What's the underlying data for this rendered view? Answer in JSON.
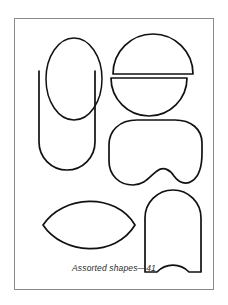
{
  "figure": {
    "caption": "Assorted shapes—41",
    "frame": {
      "border_color": "#8a8a8a",
      "background_color": "#ffffff"
    },
    "stroke_color": "#111111",
    "fill_color": "none",
    "shapes": [
      {
        "id": "ellipse-vertical",
        "name": "vertical-ellipse",
        "label": "Vertical ellipse",
        "position": "top-left"
      },
      {
        "id": "u-shape",
        "name": "open-top-u-shape",
        "label": "Open-top U shape",
        "position": "middle-left"
      },
      {
        "id": "circle-top-half",
        "name": "circle-upper-half",
        "label": "Upper half circle",
        "position": "top-right"
      },
      {
        "id": "circle-bottom-half",
        "name": "circle-lower-half",
        "label": "Lower half circle",
        "position": "top-right"
      },
      {
        "id": "kidney",
        "name": "kidney-bean-shape",
        "label": "Kidney bean shape",
        "position": "middle-right"
      },
      {
        "id": "lens",
        "name": "lens-vesica-shape",
        "label": "Lens (vesica) shape",
        "position": "bottom-left"
      },
      {
        "id": "arch-notched",
        "name": "arch-with-notch-shape",
        "label": "Arch with semicircular notch",
        "position": "bottom-right"
      }
    ]
  }
}
